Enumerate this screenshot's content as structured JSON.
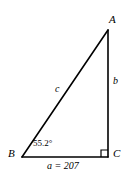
{
  "figure": {
    "type": "right-triangle-diagram",
    "background_color": "#ffffff",
    "stroke_color": "#000000",
    "width": 127,
    "height": 183
  },
  "vertices": {
    "A": {
      "label": "A",
      "x": 108,
      "y": 30
    },
    "B": {
      "label": "B",
      "x": 22,
      "y": 157
    },
    "C": {
      "label": "C",
      "x": 108,
      "y": 157
    }
  },
  "sides": {
    "a": {
      "label": "a = 207",
      "name": "a",
      "value": "207",
      "opposite_vertex": "A",
      "between": "B-C"
    },
    "b": {
      "label": "b",
      "name": "b",
      "value": "",
      "opposite_vertex": "B",
      "between": "A-C"
    },
    "c": {
      "label": "c",
      "name": "c",
      "value": "",
      "opposite_vertex": "C",
      "between": "A-B"
    }
  },
  "angles": {
    "B": {
      "label": "55.2°",
      "value": 55.2,
      "unit": "degrees",
      "at_vertex": "B"
    },
    "C": {
      "label": "",
      "value": 90,
      "unit": "degrees",
      "at_vertex": "C",
      "marker": "right-angle-square"
    }
  },
  "markers": {
    "right_angle": {
      "name": "right-angle-marker",
      "size": 7,
      "at_vertex": "C"
    }
  }
}
